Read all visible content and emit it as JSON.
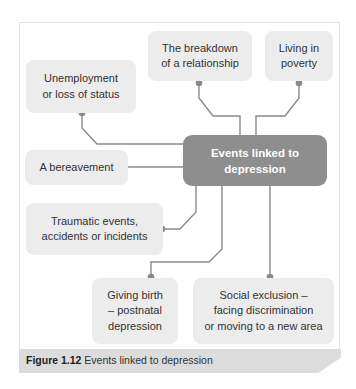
{
  "diagram": {
    "center": {
      "line1": "Events linked to",
      "line2": "depression"
    },
    "nodes": [
      {
        "id": "unemployment",
        "lines": [
          "Unemployment",
          "or loss of status"
        ]
      },
      {
        "id": "breakdown",
        "lines": [
          "The breakdown",
          "of a relationship"
        ]
      },
      {
        "id": "poverty",
        "lines": [
          "Living in",
          "poverty"
        ]
      },
      {
        "id": "bereavement",
        "lines": [
          "A bereavement"
        ]
      },
      {
        "id": "traumatic",
        "lines": [
          "Traumatic events,",
          "accidents or incidents"
        ]
      },
      {
        "id": "birth",
        "lines": [
          "Giving birth",
          "– postnatal",
          "depression"
        ]
      },
      {
        "id": "exclusion",
        "lines": [
          "Social exclusion –",
          "facing discrimination",
          "or moving to a new area"
        ]
      }
    ],
    "colors": {
      "center_fill": "#8e8e8e",
      "node_fill": "#ececec",
      "connector": "#8a8a8a",
      "caption_bar": "#dcdcdc"
    }
  },
  "caption": {
    "label": "Figure 1.12",
    "text": " Events linked to depression"
  }
}
